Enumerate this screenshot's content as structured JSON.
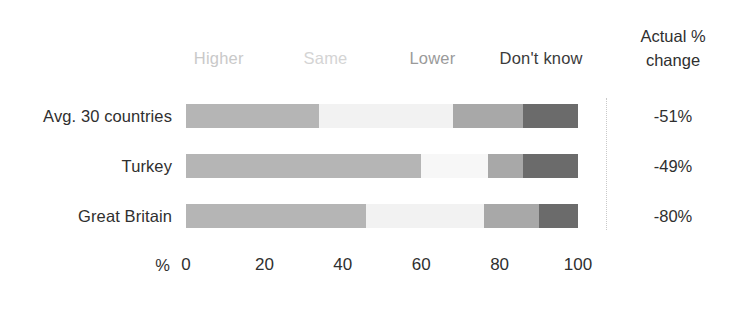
{
  "chart_data": {
    "type": "bar",
    "subtype": "stacked-horizontal-100",
    "title": "",
    "xlabel": "%",
    "ylabel": "",
    "xlim": [
      0,
      100
    ],
    "grid": false,
    "legend_position": "top",
    "categories": [
      "Avg. 30 countries",
      "Turkey",
      "Great Britain"
    ],
    "series": [
      {
        "name": "Higher",
        "color": "#b5b5b5",
        "values": [
          34,
          60,
          46
        ]
      },
      {
        "name": "Same",
        "color": "#f2f2f2",
        "values": [
          34,
          17,
          30
        ]
      },
      {
        "name": "Lower",
        "color": "#a8a8a8",
        "values": [
          18,
          9,
          14
        ]
      },
      {
        "name": "Don't know",
        "color": "#6b6b6b",
        "values": [
          14,
          14,
          10
        ]
      }
    ],
    "tick_labels": [
      "0",
      "20",
      "40",
      "60",
      "80",
      "100"
    ],
    "tick_values": [
      0,
      20,
      40,
      60,
      80,
      100
    ],
    "annotations": {
      "column_header": "Actual % change",
      "values": [
        "-51%",
        "-49%",
        "-80%"
      ]
    }
  },
  "legend": {
    "items": [
      {
        "label": "Higher",
        "color": "#c9c9c9",
        "left_pct": 2
      },
      {
        "label": "Same",
        "color": "#d4d4d4",
        "left_pct": 30
      },
      {
        "label": "Lower",
        "color": "#9a9a9a",
        "left_pct": 57
      },
      {
        "label": "Don't know",
        "color": "#3b3b3b",
        "left_pct": 80
      }
    ]
  },
  "right_column": {
    "header_line1": "Actual %",
    "header_line2": "change",
    "values": [
      "-51%",
      "-49%",
      "-80%"
    ]
  },
  "rows": [
    {
      "label": "Avg. 30 countries",
      "value": "-51%",
      "top": 98,
      "segments": [
        {
          "name": "Higher",
          "pct": 34,
          "color": "#b5b5b5"
        },
        {
          "name": "Same",
          "pct": 34,
          "color": "#f2f2f2"
        },
        {
          "name": "Lower",
          "pct": 18,
          "color": "#a8a8a8"
        },
        {
          "name": "Don't know",
          "pct": 14,
          "color": "#6b6b6b"
        }
      ]
    },
    {
      "label": "Turkey",
      "value": "-49%",
      "top": 148,
      "segments": [
        {
          "name": "Higher",
          "pct": 60,
          "color": "#b5b5b5"
        },
        {
          "name": "Same",
          "pct": 17,
          "color": "#f7f7f7"
        },
        {
          "name": "Lower",
          "pct": 9,
          "color": "#a8a8a8"
        },
        {
          "name": "Don't know",
          "pct": 14,
          "color": "#6b6b6b"
        }
      ]
    },
    {
      "label": "Great Britain",
      "value": "-80%",
      "top": 198,
      "segments": [
        {
          "name": "Higher",
          "pct": 46,
          "color": "#b5b5b5"
        },
        {
          "name": "Same",
          "pct": 30,
          "color": "#f2f2f2"
        },
        {
          "name": "Lower",
          "pct": 14,
          "color": "#a8a8a8"
        },
        {
          "name": "Don't know",
          "pct": 10,
          "color": "#6b6b6b"
        }
      ]
    }
  ],
  "axis": {
    "unit": "%",
    "ticks": [
      "0",
      "20",
      "40",
      "60",
      "80",
      "100"
    ]
  }
}
